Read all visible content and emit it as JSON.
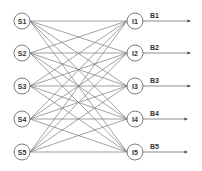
{
  "diagram": {
    "type": "bipartite-network",
    "source_nodes": [
      {
        "id": "S1",
        "label": "S1",
        "x": 22,
        "y": 21
      },
      {
        "id": "S2",
        "label": "S2",
        "x": 22,
        "y": 53
      },
      {
        "id": "S3",
        "label": "S3",
        "x": 22,
        "y": 86
      },
      {
        "id": "S4",
        "label": "S4",
        "x": 22,
        "y": 119
      },
      {
        "id": "S5",
        "label": "S5",
        "x": 22,
        "y": 152
      }
    ],
    "intermediate_nodes": [
      {
        "id": "I1",
        "label": "I1",
        "x": 135,
        "y": 21
      },
      {
        "id": "I2",
        "label": "I2",
        "x": 135,
        "y": 53
      },
      {
        "id": "I3",
        "label": "I3",
        "x": 135,
        "y": 86
      },
      {
        "id": "I4",
        "label": "I4",
        "x": 135,
        "y": 119
      },
      {
        "id": "I5",
        "label": "I5",
        "x": 135,
        "y": 152
      }
    ],
    "outputs": [
      {
        "from": "I1",
        "label": "B1",
        "end_x": 191
      },
      {
        "from": "I2",
        "label": "B2",
        "end_x": 191
      },
      {
        "from": "I3",
        "label": "B3",
        "end_x": 191
      },
      {
        "from": "I4",
        "label": "B4",
        "end_x": 188
      },
      {
        "from": "I5",
        "label": "B5",
        "end_x": 188
      }
    ],
    "edges": "all-to-all (each S connects to every I, 25 edges)",
    "node_radius": 8,
    "colors": {
      "edge": "#7a7a7a",
      "node_stroke": "#6e6e6e",
      "text": "#333333",
      "background": "#ffffff"
    }
  }
}
